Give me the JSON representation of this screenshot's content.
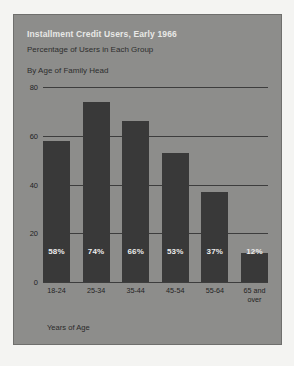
{
  "chart_data": {
    "type": "bar",
    "title": "Installment Credit Users, Early 1966",
    "subtitle": "Percentage of Users in Each Group",
    "group_label": "By Age of Family Head",
    "xlabel": "Years of Age",
    "ylabel": "",
    "ylim": [
      0,
      80
    ],
    "yticks": [
      80,
      60,
      40,
      20,
      0
    ],
    "grid": true,
    "legend": "none",
    "categories": [
      "18-24",
      "25-34",
      "35-44",
      "45-54",
      "55-64",
      "65 and over"
    ],
    "category_lines": [
      [
        "18-24"
      ],
      [
        "25-34"
      ],
      [
        "35-44"
      ],
      [
        "45-54"
      ],
      [
        "55-64"
      ],
      [
        "65 and",
        "over"
      ]
    ],
    "values": [
      58,
      74,
      66,
      53,
      37,
      12
    ],
    "value_labels": [
      "58%",
      "74%",
      "66%",
      "53%",
      "37%",
      "12%"
    ],
    "colors": {
      "panel_background": "#8d8d8b",
      "page_background": "#f4f4f2",
      "bar": "#393939",
      "gridline": "#3d3d3d",
      "title_text": "#e8e8e6",
      "body_text": "#2e2e2e",
      "value_label_text": "#ececec"
    }
  }
}
